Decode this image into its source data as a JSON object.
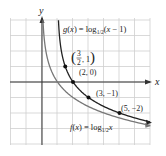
{
  "chart_data": {
    "type": "line",
    "title": "",
    "xlabel": "x",
    "ylabel": "y",
    "xlim": [
      -3,
      6
    ],
    "ylim": [
      -4,
      4
    ],
    "grid": true,
    "series": [
      {
        "name": "g(x) = log1/2(x − 1)",
        "label": "g(x) = log",
        "sub": "1/2",
        "tail": "(x − 1)",
        "color": "#222222",
        "points": [
          {
            "x": 1.5,
            "y": 1,
            "label": "(3/2, 1)"
          },
          {
            "x": 2,
            "y": 0,
            "label": "(2, 0)"
          },
          {
            "x": 3,
            "y": -1,
            "label": "(3, −1)"
          },
          {
            "x": 5,
            "y": -2,
            "label": "(5, −2)"
          }
        ]
      },
      {
        "name": "f(x) = log1/2 x",
        "label": "f(x) = log",
        "sub": "1/2",
        "tail": "x",
        "color": "#666666",
        "points": []
      }
    ]
  },
  "labels": {
    "x_axis": "x",
    "y_axis": "y",
    "p1_num": "3",
    "p1_den": "2",
    "p1_y": "1",
    "p2": "(2, 0)",
    "p3": "(3, −1)",
    "p4": "(5, −2)"
  }
}
